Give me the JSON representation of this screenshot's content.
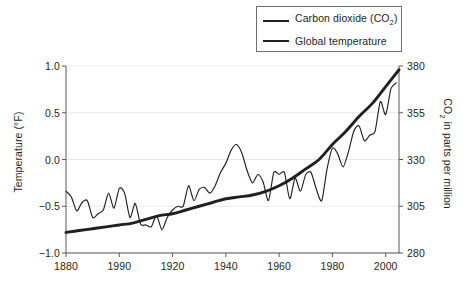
{
  "legend": {
    "position": "top-right",
    "entries": [
      {
        "label": "Carbon dioxide (CO",
        "sub": "2",
        "tail": ")",
        "style": "thick"
      },
      {
        "label": "Global temperature",
        "sub": "",
        "tail": "",
        "style": "thin"
      }
    ]
  },
  "axes": {
    "left_title_main": "Temperature (°F)",
    "right_title_pre": "CO",
    "right_title_sub": "2",
    "right_title_post": " in parts per million",
    "left_ticks": [
      "1.0",
      "0.5",
      "0.0",
      "−0.5",
      "−1.0"
    ],
    "right_ticks": [
      "380",
      "355",
      "330",
      "305",
      "280"
    ],
    "x_ticks": [
      "1880",
      "1990",
      "1920",
      "1940",
      "1960",
      "1980",
      "2000"
    ]
  },
  "colors": {
    "ink": "#231f20",
    "grid": "#e9e9ea",
    "axis": "#58585a",
    "background": "#ffffff"
  },
  "chart_data": {
    "type": "line",
    "title": "",
    "subtitle": "",
    "xlabel": "",
    "ylabel": "Temperature (°F)",
    "y2label": "CO2 in parts per million",
    "xlim": [
      1880,
      2005
    ],
    "ylim": [
      -1.0,
      1.0
    ],
    "y2lim": [
      280,
      380
    ],
    "grid": true,
    "legend_position": "top-right",
    "x_tick_values": [
      1880,
      1900,
      1920,
      1940,
      1960,
      1980,
      2000
    ],
    "x_tick_labels": [
      "1880",
      "1990",
      "1920",
      "1940",
      "1960",
      "1980",
      "2000"
    ],
    "y_tick_values": [
      -1.0,
      -0.5,
      0.0,
      0.5,
      1.0
    ],
    "y2_tick_values": [
      280,
      305,
      330,
      355,
      380
    ],
    "series": [
      {
        "name": "Carbon dioxide (CO2)",
        "axis": "right",
        "units": "ppm",
        "line_width": "thick",
        "color": "#231f20",
        "x": [
          1880,
          1885,
          1890,
          1895,
          1900,
          1905,
          1910,
          1915,
          1920,
          1925,
          1930,
          1935,
          1940,
          1945,
          1950,
          1955,
          1960,
          1965,
          1970,
          1975,
          1980,
          1985,
          1990,
          1995,
          2000,
          2005
        ],
        "values": [
          291,
          292,
          293,
          294,
          295,
          296,
          298,
          300,
          301,
          303,
          305,
          307,
          309,
          310,
          311,
          313,
          316,
          320,
          325,
          330,
          338,
          345,
          353,
          360,
          369,
          378
        ]
      },
      {
        "name": "Global temperature",
        "axis": "left",
        "units": "°F",
        "line_width": "thin",
        "color": "#231f20",
        "x": [
          1880,
          1882,
          1884,
          1886,
          1888,
          1890,
          1892,
          1894,
          1896,
          1898,
          1900,
          1902,
          1904,
          1906,
          1908,
          1910,
          1912,
          1914,
          1916,
          1918,
          1920,
          1922,
          1924,
          1926,
          1928,
          1930,
          1932,
          1934,
          1936,
          1938,
          1940,
          1942,
          1944,
          1946,
          1948,
          1950,
          1952,
          1954,
          1956,
          1958,
          1960,
          1962,
          1964,
          1966,
          1968,
          1970,
          1972,
          1974,
          1976,
          1978,
          1980,
          1982,
          1984,
          1986,
          1988,
          1990,
          1992,
          1994,
          1996,
          1998,
          2000,
          2002,
          2004
        ],
        "values": [
          -0.34,
          -0.4,
          -0.55,
          -0.46,
          -0.44,
          -0.62,
          -0.58,
          -0.54,
          -0.36,
          -0.52,
          -0.31,
          -0.36,
          -0.62,
          -0.47,
          -0.69,
          -0.7,
          -0.72,
          -0.6,
          -0.75,
          -0.62,
          -0.54,
          -0.5,
          -0.5,
          -0.28,
          -0.44,
          -0.32,
          -0.3,
          -0.36,
          -0.28,
          -0.14,
          -0.04,
          0.1,
          0.16,
          0.07,
          -0.12,
          -0.25,
          -0.16,
          -0.24,
          -0.44,
          -0.14,
          -0.16,
          -0.14,
          -0.42,
          -0.2,
          -0.34,
          -0.16,
          -0.14,
          -0.32,
          -0.44,
          -0.1,
          0.12,
          0.06,
          -0.08,
          0.08,
          0.3,
          0.36,
          0.2,
          0.26,
          0.3,
          0.62,
          0.48,
          0.76,
          0.82
        ],
        "annotations": [
          {
            "text": "peak mid-1940s",
            "x": 1944,
            "y": 0.16
          },
          {
            "text": "record high near end of record",
            "x": 2004,
            "y": 0.82
          }
        ]
      }
    ]
  }
}
